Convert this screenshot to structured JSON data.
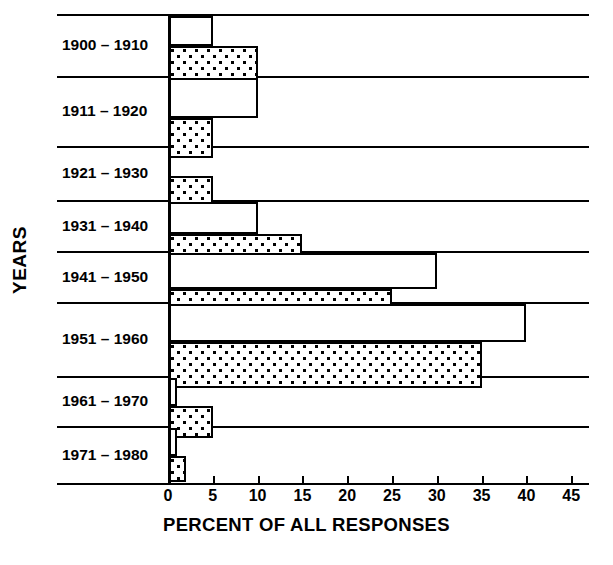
{
  "chart_data": {
    "type": "bar",
    "orientation": "horizontal",
    "title": "",
    "xlabel": "PERCENT OF ALL RESPONSES",
    "ylabel": "YEARS",
    "xlim": [
      0,
      45
    ],
    "xticks": [
      0,
      5,
      10,
      15,
      20,
      25,
      30,
      35,
      40,
      45
    ],
    "xtick_labels": [
      "0",
      "5",
      "10",
      "15",
      "20",
      "25",
      "30",
      "35",
      "40",
      "45"
    ],
    "grid": false,
    "legend": "none",
    "categories": [
      "1900 – 1910",
      "1911 – 1920",
      "1921 – 1930",
      "1931 – 1940",
      "1941 – 1950",
      "1951 – 1960",
      "1961 – 1970",
      "1971 – 1980"
    ],
    "series": [
      {
        "name": "open-bar",
        "fill": "white",
        "values": [
          5,
          10,
          0,
          10,
          30,
          40,
          1,
          1
        ]
      },
      {
        "name": "dotted-bar",
        "fill": "dotted",
        "values": [
          10,
          5,
          5,
          15,
          25,
          35,
          5,
          2
        ]
      }
    ]
  },
  "axes": {
    "y_title": "YEARS",
    "x_title": "PERCENT OF ALL RESPONSES"
  },
  "colors": {
    "ink": "#000000",
    "paper": "#ffffff"
  }
}
